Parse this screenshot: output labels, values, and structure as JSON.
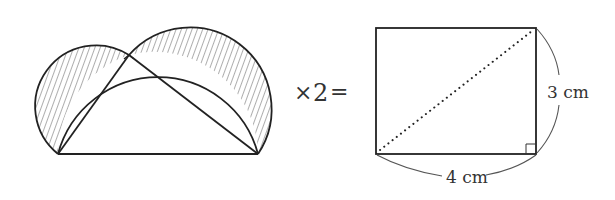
{
  "figure": {
    "type": "geometry-equation",
    "left_shape": {
      "description": "right triangle inscribed in a semicircle with semicircles on each leg; shaded lunes",
      "triangle": {
        "A": [
          58,
          154
        ],
        "B": [
          258,
          154
        ],
        "C": [
          129,
          55
        ]
      },
      "shaded_regions": [
        "left-lune",
        "right-lune"
      ]
    },
    "operator": {
      "multiply_symbol": "×",
      "factor": "2",
      "equals_symbol": "=",
      "text": "×2="
    },
    "right_shape": {
      "description": "rectangle with dotted diagonal",
      "width_label": "4 cm",
      "height_label": "3 cm",
      "right_angle_marker": true
    }
  },
  "colors": {
    "stroke": "#222222",
    "hatch": "#333333",
    "label": "#333333",
    "brace": "#555555"
  }
}
